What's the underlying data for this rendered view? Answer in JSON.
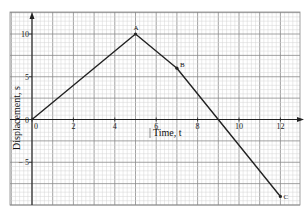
{
  "chart_data": {
    "type": "line",
    "title": "",
    "xlabel": "Time, t",
    "ylabel": "Displacement, s",
    "x_ticks": [
      "0",
      "2",
      "4",
      "6",
      "8",
      "10",
      "12"
    ],
    "y_ticks": [
      "10",
      "5",
      "0",
      "− 5"
    ],
    "xlim": [
      -1,
      12.9
    ],
    "ylim": [
      -10,
      12.5
    ],
    "grid": true,
    "legend": null,
    "series": [
      {
        "name": "displacement",
        "points": [
          {
            "label": "",
            "x": 0,
            "y": 0
          },
          {
            "label": "A",
            "x": 5,
            "y": 10
          },
          {
            "label": "B",
            "x": 7,
            "y": 6
          },
          {
            "label": "C",
            "x": 12,
            "y": -9
          }
        ]
      }
    ]
  },
  "colors": {
    "minor_grid": "#d4d4d4",
    "major_grid": "#8a8a8a",
    "axis": "#222222",
    "line": "#222222"
  }
}
